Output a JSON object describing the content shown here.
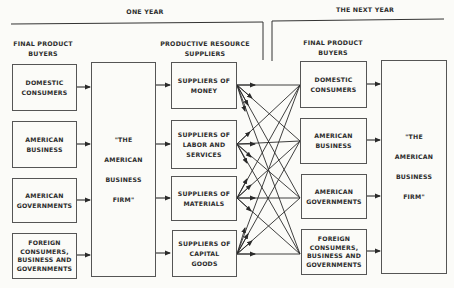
{
  "periods": {
    "one_year": "ONE YEAR",
    "next_year": "THE NEXT YEAR"
  },
  "columns": {
    "final_buyers_left": "FINAL PRODUCT\nBUYERS",
    "resource_suppliers": "PRODUCTIVE RESOURCE\nSUPPLIERS",
    "final_buyers_right": "FINAL PRODUCT\nBUYERS"
  },
  "buyers_left": [
    {
      "label": "DOMESTIC\nCONSUMERS"
    },
    {
      "label": "AMERICAN\nBUSINESS"
    },
    {
      "label": "AMERICAN\nGOVERNMENTS"
    },
    {
      "label": "FOREIGN\nCONSUMERS,\nBUSINESS AND\nGOVERNMENTS"
    }
  ],
  "firm_left": {
    "label": "\"THE\n\nAMERICAN\n\nBUSINESS\n\nFIRM\""
  },
  "suppliers": [
    {
      "label": "SUPPLIERS OF\nMONEY"
    },
    {
      "label": "SUPPLIERS OF\nLABOR AND\nSERVICES"
    },
    {
      "label": "SUPPLIERS OF\nMATERIALS"
    },
    {
      "label": "SUPPLIERS OF\nCAPITAL\nGOODS"
    }
  ],
  "buyers_right": [
    {
      "label": "DOMESTIC\nCONSUMERS"
    },
    {
      "label": "AMERICAN\nBUSINESS"
    },
    {
      "label": "AMERICAN\nGOVERNMENTS"
    },
    {
      "label": "FOREIGN\nCONSUMERS,\nBUSINESS AND\nGOVERNMENTS"
    }
  ],
  "firm_right": {
    "label": "\"THE\n\nAMERICAN\n\nBUSINESS\n\nFIRM\""
  },
  "colors": {
    "line": "#2a2a2a",
    "box_border": "#555555",
    "background": "#fbfbf8"
  }
}
